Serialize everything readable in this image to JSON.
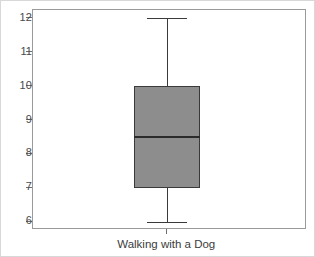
{
  "chart_data": {
    "type": "box",
    "title": "",
    "xlabel": "",
    "ylabel": "",
    "categories": [
      "Walking with a Dog"
    ],
    "y_ticks": [
      12,
      11,
      10,
      9,
      8,
      7,
      6
    ],
    "ylim": [
      5.75,
      12.25
    ],
    "grid": false,
    "legend": "none",
    "series": [
      {
        "name": "Walking with a Dog",
        "min": 6,
        "q1": 7,
        "median": 8.5,
        "q3": 10,
        "max": 12
      }
    ],
    "colors": {
      "box_fill": "#8d8d8d",
      "box_border": "#3a3a3a",
      "median": "#2b2b2b",
      "whisker": "#3a3a3a",
      "axis": "#9a9a9a",
      "tick_label": "#4a4a4a",
      "category_label": "#3c3c3c",
      "background": "#ffffff"
    }
  },
  "axis": {
    "y_tick_labels": [
      "12",
      "11",
      "10",
      "9",
      "8",
      "7",
      "6"
    ],
    "x_tick_label": "Walking with a Dog"
  }
}
